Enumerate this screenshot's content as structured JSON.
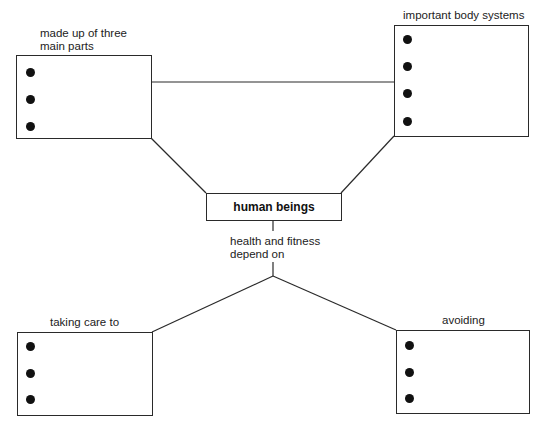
{
  "diagram": {
    "center": {
      "label": "human beings"
    },
    "connector_label": {
      "line1": "health and fitness",
      "line2": "depend on"
    },
    "nodes": [
      {
        "id": "top-left",
        "label_line1": "made up of three",
        "label_line2": "main parts",
        "bullets": 3
      },
      {
        "id": "top-right",
        "label_line1": "important body systems",
        "bullets": 4
      },
      {
        "id": "bottom-left",
        "label_line1": "taking care to",
        "bullets": 3
      },
      {
        "id": "bottom-right",
        "label_line1": "avoiding",
        "bullets": 3
      }
    ]
  },
  "colors": {
    "line": "#2a2a2a",
    "bullet": "#111111",
    "background": "#ffffff"
  }
}
